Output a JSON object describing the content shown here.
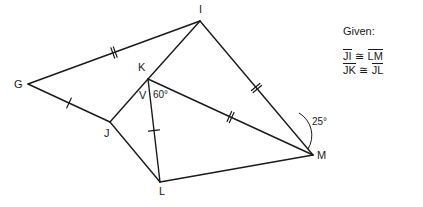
{
  "figure": {
    "stroke_color": "#1a1a1a",
    "background": "#ffffff",
    "vertices": [
      {
        "name": "G",
        "label": "G",
        "x": 28,
        "y": 84,
        "label_x": 14,
        "label_y": 79
      },
      {
        "name": "I",
        "label": "I",
        "x": 200,
        "y": 21,
        "label_x": 199,
        "label_y": 4
      },
      {
        "name": "K",
        "label": "K",
        "x": 148,
        "y": 79,
        "label_x": 138,
        "label_y": 62
      },
      {
        "name": "J",
        "label": "J",
        "x": 110,
        "y": 122,
        "label_x": 104,
        "label_y": 128
      },
      {
        "name": "L",
        "label": "L",
        "x": 160,
        "y": 182,
        "label_x": 159,
        "label_y": 186
      },
      {
        "name": "M",
        "label": "M",
        "x": 313,
        "y": 155,
        "label_x": 317,
        "label_y": 150
      },
      {
        "name": "V",
        "label": "V",
        "x": 146,
        "y": 96,
        "label_x": 139,
        "label_y": 90
      }
    ],
    "edges": [
      {
        "name": "segment-G-I",
        "from": "G",
        "to": "I",
        "ticks": 2
      },
      {
        "name": "segment-G-J",
        "from": "G",
        "to": "J",
        "ticks": 1
      },
      {
        "name": "segment-J-K",
        "from": "J",
        "to": "K",
        "ticks": 0
      },
      {
        "name": "segment-K-I",
        "from": "K",
        "to": "I",
        "ticks": 0
      },
      {
        "name": "segment-I-M",
        "from": "I",
        "to": "M",
        "ticks": 2
      },
      {
        "name": "segment-K-M",
        "from": "K",
        "to": "M",
        "ticks": 2
      },
      {
        "name": "segment-K-L",
        "from": "K",
        "to": "L",
        "ticks": 1
      },
      {
        "name": "segment-J-L",
        "from": "J",
        "to": "L",
        "ticks": 0
      },
      {
        "name": "segment-L-M",
        "from": "L",
        "to": "M",
        "ticks": 0
      }
    ],
    "angles": [
      {
        "name": "angle-at-K",
        "label": "60°",
        "vertex": "K",
        "label_x": 153,
        "label_y": 90
      },
      {
        "name": "angle-at-M",
        "label": "25°",
        "vertex": "M",
        "label_x": 312,
        "label_y": 117
      }
    ]
  },
  "given": {
    "title": "Given:",
    "title_x": 343,
    "title_y": 26,
    "statements": [
      {
        "left": "JI",
        "relation": "≅",
        "right": "LM"
      },
      {
        "left": "JK",
        "relation": "≅",
        "right": "JL"
      }
    ]
  }
}
